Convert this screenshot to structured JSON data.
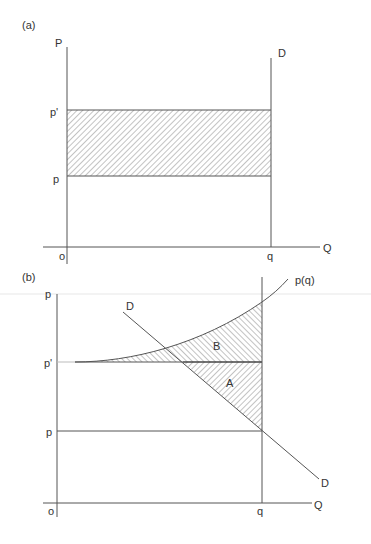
{
  "panel_a": {
    "label": "(a)",
    "y_axis_label": "P",
    "x_axis_label": "Q",
    "origin_label": "o",
    "tick_p_prime": "p'",
    "tick_p": "p",
    "tick_q": "q",
    "demand_label": "D"
  },
  "panel_b": {
    "label": "(b)",
    "y_axis_label": "p",
    "x_axis_label": "Q",
    "origin_label": "o",
    "tick_p_prime": "p'",
    "tick_p": "p",
    "tick_q": "q",
    "demand_label_top": "D",
    "demand_label_bottom": "D",
    "curve_label": "p(q)",
    "region_a_label": "A",
    "region_b_label": "B"
  },
  "colors": {
    "line": "#555555",
    "text": "#333333",
    "hatch": "#888888",
    "background": "#ffffff"
  }
}
